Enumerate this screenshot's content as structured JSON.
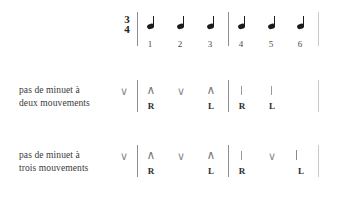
{
  "figure": {
    "time_signature": {
      "numerator": "3",
      "denominator": "4"
    },
    "beat_numbers": [
      "1",
      "2",
      "3",
      "4",
      "5",
      "6"
    ],
    "note_symbol": "quarter-note",
    "notes_count": 6,
    "colors": {
      "ink": "#2b2b2b",
      "note": "#1c1c1c",
      "barline": "#8d8d8d",
      "barline_faint": "#c9c9c9",
      "symbol": "#7a7a7a",
      "background": "#ffffff"
    },
    "symbols_legend": {
      "caret": "∧",
      "vee": "∨",
      "tick": "|",
      "hook": "j"
    },
    "rows": [
      {
        "id": "deux-mouvements",
        "label_line1": "pas de minuet à",
        "label_line2": "deux mouvements",
        "upbeat_symbol": "∨",
        "beats": [
          {
            "beat": "1",
            "symbol": "∧",
            "foot": "R"
          },
          {
            "beat": "2",
            "symbol": "∨",
            "foot": ""
          },
          {
            "beat": "3",
            "symbol": "∧",
            "foot": "L"
          },
          {
            "beat": "4",
            "symbol": "|",
            "foot": "R"
          },
          {
            "beat": "5",
            "symbol": "|",
            "foot": "L"
          },
          {
            "beat": "6",
            "symbol": "",
            "foot": ""
          }
        ]
      },
      {
        "id": "trois-mouvements",
        "label_line1": "pas de minuet à",
        "label_line2": "trois mouvements",
        "upbeat_symbol": "∨",
        "beats": [
          {
            "beat": "1",
            "symbol": "∧",
            "foot": "R"
          },
          {
            "beat": "2",
            "symbol": "∨",
            "foot": ""
          },
          {
            "beat": "3",
            "symbol": "∧",
            "foot": "L"
          },
          {
            "beat": "4",
            "symbol": "|",
            "foot": "R"
          },
          {
            "beat": "5",
            "symbol": "∨",
            "foot": ""
          },
          {
            "beat": "6",
            "symbol": "j",
            "foot": "L"
          }
        ]
      }
    ]
  }
}
